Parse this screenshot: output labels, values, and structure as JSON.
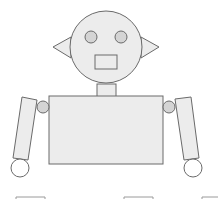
{
  "diagram": {
    "colors": {
      "fill": "#ececec",
      "eye_fill": "#d4d4d4",
      "stroke": "#6a6a6a",
      "background": "#ffffff"
    },
    "parts": [
      "head",
      "left-eye",
      "right-eye",
      "mouth",
      "left-ear",
      "right-ear",
      "neck",
      "torso",
      "left-shoulder",
      "right-shoulder",
      "left-arm",
      "right-arm",
      "left-hand",
      "right-hand"
    ]
  }
}
